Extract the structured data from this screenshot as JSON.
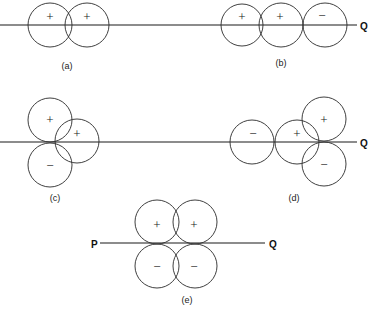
{
  "figure": {
    "panels": [
      {
        "id": "a",
        "label": "(a)",
        "signs": [
          "+",
          "+"
        ]
      },
      {
        "id": "b",
        "label": "(b)",
        "signs": [
          "+",
          "+",
          "−"
        ],
        "end_label": "Q"
      },
      {
        "id": "c",
        "label": "(c)",
        "signs": [
          "+",
          "+",
          "−"
        ]
      },
      {
        "id": "d",
        "label": "(d)",
        "signs": [
          "−",
          "+",
          "+",
          "−"
        ],
        "end_label": "Q"
      },
      {
        "id": "e",
        "label": "(e)",
        "signs": [
          "+",
          "+",
          "−",
          "−"
        ],
        "start_label": "P",
        "end_label": "Q"
      }
    ]
  }
}
